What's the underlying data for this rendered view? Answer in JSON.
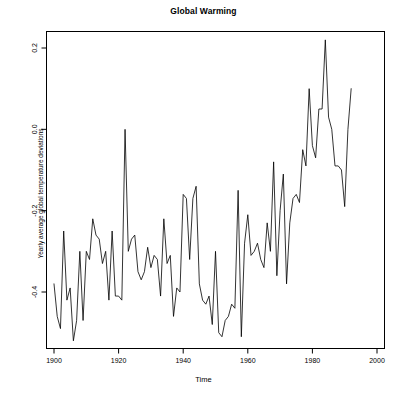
{
  "chart_data": {
    "type": "line",
    "title": "Global Warming",
    "xlabel": "Time",
    "ylabel": "Yearly average global temperature deviations",
    "grid": false,
    "legend": "none",
    "xlim": [
      1900,
      1997
    ],
    "ylim": [
      -0.52,
      0.24
    ],
    "xticks": [
      1900,
      1920,
      1940,
      1960,
      1980,
      2000
    ],
    "xtick_labels": [
      "1900",
      "1920",
      "1940",
      "1960",
      "1980",
      "2000"
    ],
    "yticks": [
      0.2,
      0.0,
      -0.2,
      -0.4
    ],
    "ytick_labels": [
      "0.2",
      "0.0",
      "-0.2",
      "-0.4"
    ],
    "line_color": "#000000",
    "line_width": 0.8,
    "x": [
      1900,
      1901,
      1902,
      1903,
      1904,
      1905,
      1906,
      1907,
      1908,
      1909,
      1910,
      1911,
      1912,
      1913,
      1914,
      1915,
      1916,
      1917,
      1918,
      1919,
      1920,
      1921,
      1922,
      1923,
      1924,
      1925,
      1926,
      1927,
      1928,
      1929,
      1930,
      1931,
      1932,
      1933,
      1934,
      1935,
      1936,
      1937,
      1938,
      1939,
      1940,
      1941,
      1942,
      1943,
      1944,
      1945,
      1946,
      1947,
      1948,
      1949,
      1950,
      1951,
      1952,
      1953,
      1954,
      1955,
      1956,
      1957,
      1958,
      1959,
      1960,
      1961,
      1962,
      1963,
      1964,
      1965,
      1966,
      1967,
      1968,
      1969,
      1970,
      1971,
      1972,
      1973,
      1974,
      1975,
      1976,
      1977,
      1978,
      1979,
      1980,
      1981,
      1982,
      1983,
      1984,
      1985,
      1986,
      1987,
      1988,
      1989,
      1990,
      1991,
      1992,
      1993,
      1994,
      1995,
      1996,
      1997
    ],
    "y": [
      -0.38,
      -0.46,
      -0.49,
      -0.25,
      -0.42,
      -0.39,
      -0.52,
      -0.47,
      -0.3,
      -0.47,
      -0.3,
      -0.32,
      -0.22,
      -0.26,
      -0.27,
      -0.33,
      -0.3,
      -0.42,
      -0.25,
      -0.41,
      -0.41,
      -0.42,
      0.0,
      -0.3,
      -0.27,
      -0.26,
      -0.35,
      -0.37,
      -0.35,
      -0.29,
      -0.34,
      -0.31,
      -0.32,
      -0.41,
      -0.22,
      -0.33,
      -0.31,
      -0.46,
      -0.39,
      -0.4,
      -0.16,
      -0.17,
      -0.32,
      -0.17,
      -0.14,
      -0.38,
      -0.42,
      -0.43,
      -0.41,
      -0.48,
      -0.3,
      -0.5,
      -0.51,
      -0.47,
      -0.46,
      -0.43,
      -0.44,
      -0.15,
      -0.51,
      -0.28,
      -0.21,
      -0.31,
      -0.3,
      -0.28,
      -0.32,
      -0.34,
      -0.23,
      -0.3,
      -0.08,
      -0.36,
      -0.2,
      -0.11,
      -0.38,
      -0.23,
      -0.17,
      -0.16,
      -0.18,
      -0.05,
      -0.09,
      0.1,
      -0.04,
      -0.07,
      0.05,
      0.05,
      0.22,
      0.03,
      0.0,
      -0.09,
      -0.09,
      -0.1,
      -0.19,
      0.0,
      0.1
    ]
  }
}
